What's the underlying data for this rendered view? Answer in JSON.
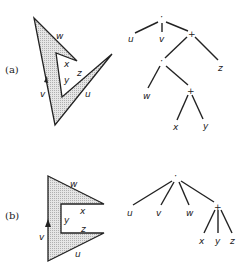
{
  "figures": [
    {
      "tag": "(a)",
      "polygon": {
        "points": "34,18 77,61 56,53 62,97 112,54 55,125",
        "fill": "#d4d4d4",
        "edge_labels": {
          "w": "w",
          "x": "x",
          "y": "y",
          "z": "z",
          "u": "u",
          "v": "v"
        }
      },
      "tree": {
        "root": "·",
        "nodes": [
          "·",
          "u",
          "v",
          "+",
          "·",
          "z",
          "w",
          "+",
          "x",
          "y"
        ]
      }
    },
    {
      "tag": "(b)",
      "polygon": {
        "points": "48,176 104,204 61,204 61,233 104,233 48,261",
        "fill": "#d4d4d4",
        "edge_labels": {
          "w": "w",
          "x": "x",
          "y": "y",
          "z": "z",
          "u": "u",
          "v": "v"
        }
      },
      "tree": {
        "root": "·",
        "nodes": [
          "·",
          "u",
          "v",
          "w",
          "+",
          "x",
          "y",
          "z"
        ]
      }
    }
  ]
}
